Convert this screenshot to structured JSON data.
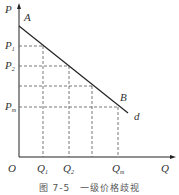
{
  "diagram": {
    "caption": "图 7-5　一级价格歧视",
    "axes": {
      "y_label": "P",
      "x_label": "Q",
      "origin_label": "O"
    },
    "curve": {
      "start_label": "A",
      "point_label": "B",
      "end_label": "d"
    },
    "price_levels": [
      {
        "base": "P",
        "sub": "1"
      },
      {
        "base": "P",
        "sub": "2"
      },
      {
        "base": "",
        "sub": ""
      },
      {
        "base": "P",
        "sub": "m"
      }
    ],
    "quantity_levels": [
      {
        "base": "Q",
        "sub": "1"
      },
      {
        "base": "Q",
        "sub": "2"
      },
      {
        "base": "",
        "sub": ""
      },
      {
        "base": "Q",
        "sub": "m"
      }
    ],
    "colors": {
      "line": "#222222",
      "dashed": "#555555",
      "text": "#333333"
    }
  }
}
